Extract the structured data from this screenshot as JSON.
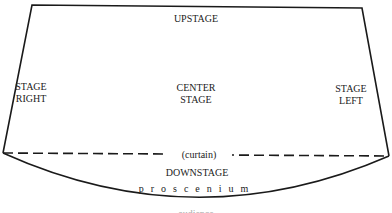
{
  "diagram": {
    "type": "stage-layout",
    "labels": {
      "upstage": "UPSTAGE",
      "stage_right_line1": "STAGE",
      "stage_right_line2": "RIGHT",
      "center_stage_line1": "CENTER",
      "center_stage_line2": "STAGE",
      "stage_left_line1": "STAGE",
      "stage_left_line2": "LEFT",
      "curtain": "(curtain)",
      "downstage": "DOWNSTAGE",
      "proscenium": "proscenium",
      "audience_partial": "audience"
    },
    "colors": {
      "line": "#1a1a1a",
      "background": "#ffffff"
    }
  }
}
